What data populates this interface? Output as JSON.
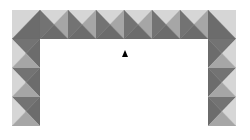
{
  "scene": {
    "background": "#ffffff",
    "tile_size": {
      "w": 28,
      "h": 29
    },
    "colors": {
      "light": "#d6d6d6",
      "medium": "#a6a6a6",
      "dark": "#737373",
      "darker": "#6c6c6c"
    },
    "tiles": [
      {
        "x": 12,
        "y": 10,
        "type": "corner-top-left"
      },
      {
        "x": 40,
        "y": 10,
        "type": "top"
      },
      {
        "x": 68,
        "y": 10,
        "type": "top"
      },
      {
        "x": 96,
        "y": 10,
        "type": "top"
      },
      {
        "x": 124,
        "y": 10,
        "type": "top"
      },
      {
        "x": 152,
        "y": 10,
        "type": "top"
      },
      {
        "x": 180,
        "y": 10,
        "type": "top"
      },
      {
        "x": 208,
        "y": 10,
        "type": "corner-top-right"
      },
      {
        "x": 12,
        "y": 39,
        "type": "left"
      },
      {
        "x": 12,
        "y": 68,
        "type": "left"
      },
      {
        "x": 12,
        "y": 97,
        "type": "left"
      },
      {
        "x": 208,
        "y": 39,
        "type": "right"
      },
      {
        "x": 208,
        "y": 68,
        "type": "right"
      },
      {
        "x": 208,
        "y": 97,
        "type": "right"
      }
    ],
    "cursor": {
      "x": 122,
      "y": 50,
      "icon": "triangle-pointer-icon"
    }
  }
}
